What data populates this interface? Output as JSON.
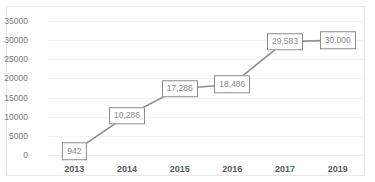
{
  "title_strip": {
    "text": "····· ······ ····"
  },
  "colors": {
    "line": "#8c8c8c",
    "label_border": "#8c8c8c",
    "label_text": "#8a8a8a",
    "label_fill": "#ffffff",
    "gridline": "#f2f2f2",
    "axis_text": "#7a7a7a",
    "xaxis_text": "#5c5c5c",
    "frame_border": "#e8e8e8",
    "background": "#ffffff"
  },
  "chart_data": {
    "type": "line",
    "title": "",
    "xlabel": "",
    "ylabel": "",
    "categories": [
      "2013",
      "2014",
      "2015",
      "2016",
      "2017",
      "2019"
    ],
    "values": [
      942,
      10286,
      17286,
      18486,
      29583,
      30000
    ],
    "point_labels": [
      "942",
      "10,286",
      "17,286",
      "18,486",
      "29,583",
      "30,000"
    ],
    "ylim": [
      0,
      35000
    ],
    "yticks": [
      0,
      5000,
      10000,
      15000,
      20000,
      25000,
      30000,
      35000
    ],
    "ytick_labels": [
      "0",
      "5000",
      "10000",
      "15000",
      "20000",
      "25000",
      "30000",
      "35000"
    ],
    "grid": true,
    "legend": false,
    "markers": "data-label-boxes"
  }
}
